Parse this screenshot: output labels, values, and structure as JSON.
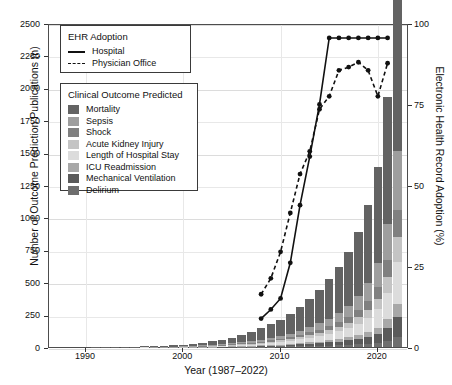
{
  "axes": {
    "xlabel": "Year (1987–2022)",
    "ylabel_left": "Number of Outcome Prediction Publications (n)",
    "ylabel_right": "Electronic Health Record Adoption (%)",
    "xticks": [
      "1990",
      "2000",
      "2010",
      "2020"
    ],
    "xtick_values": [
      1990,
      2000,
      2010,
      2020
    ],
    "yticks_left": [
      "0",
      "250",
      "500",
      "750",
      "1000",
      "1250",
      "1500",
      "1750",
      "2000",
      "2250",
      "2500"
    ],
    "yticks_right": [
      "0",
      "25",
      "50",
      "75",
      "100"
    ],
    "xlim": [
      1986.2,
      2023.2
    ],
    "ylim_left": [
      0,
      2500
    ],
    "ylim_right": [
      0,
      100
    ]
  },
  "legend_ehr": {
    "title": "EHR Adoption",
    "items": [
      {
        "label": "Hospital",
        "style": "solid",
        "icon": "solid-line-icon"
      },
      {
        "label": "Physician Office",
        "style": "dashed",
        "icon": "dashed-line-icon"
      }
    ]
  },
  "legend_outcome": {
    "title": "Clinical Outcome Predicted",
    "items": [
      {
        "label": "Mortality",
        "color": "#636363"
      },
      {
        "label": "Sepsis",
        "color": "#9e9e9e"
      },
      {
        "label": "Shock",
        "color": "#808080"
      },
      {
        "label": "Acute Kidney Injury",
        "color": "#c4c4c4"
      },
      {
        "label": "Length of Hospital Stay",
        "color": "#dcdcdc"
      },
      {
        "label": "ICU Readmission",
        "color": "#a8a8a8"
      },
      {
        "label": "Mechanical Ventilation",
        "color": "#5a5a5a"
      },
      {
        "label": "Delirium",
        "color": "#6e6e6e"
      }
    ]
  },
  "chart_data": {
    "type": "bar",
    "title": "",
    "xlabel": "Year (1987–2022)",
    "ylabel": "Number of Outcome Prediction Publications (n)",
    "ylabel_secondary": "Electronic Health Record Adoption (%)",
    "grid": true,
    "legend_position": "upper-left",
    "stacked": true,
    "categories": [
      1987,
      1988,
      1989,
      1990,
      1991,
      1992,
      1993,
      1994,
      1995,
      1996,
      1997,
      1998,
      1999,
      2000,
      2001,
      2002,
      2003,
      2004,
      2005,
      2006,
      2007,
      2008,
      2009,
      2010,
      2011,
      2012,
      2013,
      2014,
      2015,
      2016,
      2017,
      2018,
      2019,
      2020,
      2021,
      2022
    ],
    "series": [
      {
        "name": "Mortality",
        "color": "#636363",
        "values": [
          0,
          0,
          0,
          0,
          1,
          1,
          1,
          2,
          3,
          4,
          5,
          6,
          8,
          12,
          16,
          20,
          26,
          34,
          44,
          58,
          72,
          88,
          104,
          124,
          150,
          182,
          216,
          258,
          304,
          356,
          420,
          500,
          600,
          740,
          980,
          1560
        ]
      },
      {
        "name": "Sepsis",
        "color": "#9e9e9e",
        "values": [
          0,
          0,
          0,
          0,
          0,
          0,
          0,
          0,
          0,
          0,
          1,
          1,
          1,
          2,
          2,
          3,
          4,
          5,
          7,
          9,
          12,
          15,
          18,
          22,
          27,
          33,
          40,
          48,
          58,
          70,
          86,
          108,
          140,
          190,
          280,
          450
        ]
      },
      {
        "name": "Shock",
        "color": "#808080",
        "values": [
          0,
          0,
          0,
          0,
          0,
          0,
          0,
          0,
          0,
          0,
          0,
          0,
          1,
          1,
          1,
          2,
          2,
          3,
          4,
          5,
          6,
          8,
          10,
          12,
          15,
          18,
          22,
          26,
          31,
          37,
          44,
          54,
          68,
          90,
          135,
          210
        ]
      },
      {
        "name": "Acute Kidney Injury",
        "color": "#c4c4c4",
        "values": [
          0,
          0,
          0,
          0,
          0,
          0,
          0,
          0,
          0,
          0,
          0,
          0,
          0,
          1,
          1,
          1,
          2,
          2,
          3,
          4,
          5,
          6,
          8,
          10,
          12,
          15,
          18,
          22,
          26,
          31,
          38,
          47,
          60,
          80,
          120,
          195
        ]
      },
      {
        "name": "Length of Hospital Stay",
        "color": "#dcdcdc",
        "values": [
          0,
          0,
          0,
          0,
          0,
          0,
          0,
          0,
          0,
          1,
          1,
          1,
          2,
          2,
          3,
          4,
          5,
          6,
          8,
          10,
          12,
          15,
          18,
          22,
          26,
          31,
          37,
          44,
          52,
          62,
          74,
          90,
          112,
          145,
          205,
          320
        ]
      },
      {
        "name": "ICU Readmission",
        "color": "#a8a8a8",
        "values": [
          0,
          0,
          0,
          0,
          0,
          0,
          0,
          0,
          0,
          0,
          0,
          0,
          0,
          0,
          1,
          1,
          1,
          2,
          2,
          3,
          3,
          4,
          5,
          6,
          8,
          9,
          11,
          13,
          16,
          19,
          23,
          28,
          35,
          45,
          65,
          100
        ]
      },
      {
        "name": "Mechanical Ventilation",
        "color": "#5a5a5a",
        "values": [
          0,
          0,
          0,
          0,
          0,
          0,
          0,
          0,
          0,
          0,
          0,
          0,
          0,
          1,
          1,
          1,
          2,
          2,
          3,
          4,
          5,
          6,
          8,
          9,
          11,
          14,
          17,
          20,
          24,
          29,
          35,
          43,
          54,
          70,
          100,
          160
        ]
      },
      {
        "name": "Delirium",
        "color": "#6e6e6e",
        "values": [
          0,
          0,
          0,
          0,
          0,
          0,
          0,
          0,
          0,
          0,
          0,
          0,
          0,
          0,
          0,
          0,
          1,
          1,
          1,
          2,
          2,
          3,
          3,
          4,
          5,
          6,
          8,
          9,
          11,
          13,
          16,
          20,
          25,
          32,
          48,
          75
        ]
      }
    ],
    "lines": [
      {
        "name": "Hospital",
        "style": "solid",
        "color": "#111111",
        "x": [
          2008,
          2009,
          2010,
          2011,
          2012,
          2013,
          2014,
          2015,
          2016,
          2017,
          2018,
          2019,
          2020,
          2021
        ],
        "y": [
          9.4,
          12.2,
          15.6,
          26.6,
          44.4,
          59.4,
          75.5,
          96.0,
          96.0,
          96.0,
          96.0,
          96.0,
          96.0,
          96.0
        ]
      },
      {
        "name": "Physician Office",
        "style": "dashed",
        "color": "#111111",
        "x": [
          2008,
          2009,
          2010,
          2011,
          2012,
          2013,
          2014,
          2015,
          2016,
          2017,
          2018,
          2019,
          2020,
          2021
        ],
        "y": [
          16.9,
          21.8,
          30.0,
          42.0,
          54.0,
          61.0,
          74.0,
          78.0,
          86.0,
          87.0,
          88.5,
          86.0,
          78.0,
          88.2
        ]
      }
    ]
  }
}
